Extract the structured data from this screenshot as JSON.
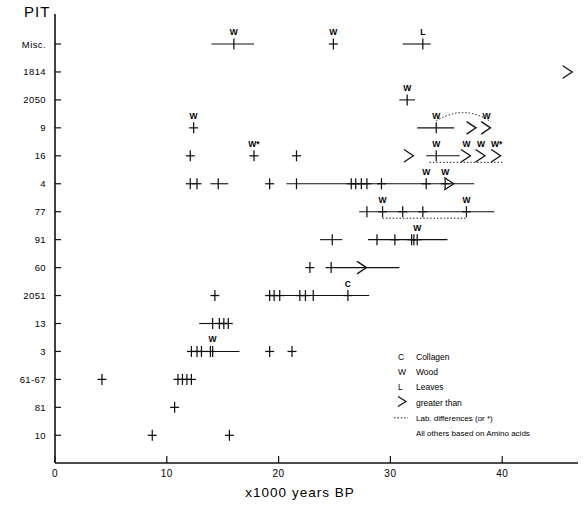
{
  "chart_data": {
    "type": "scatter",
    "title": "",
    "ylabel": "PIT",
    "xlabel": "x1000 years BP",
    "xlim": [
      0,
      41
    ],
    "xticks": [
      0,
      10,
      20,
      30,
      40
    ],
    "xticklabels": [
      "0",
      "10",
      "20",
      "30",
      "40"
    ],
    "grid": false,
    "ycategories": [
      "Misc.",
      "1814",
      "2050",
      "9",
      "16",
      "4",
      "77",
      "91",
      "60",
      "2051",
      "13",
      "3",
      "61-67",
      "81",
      "10"
    ],
    "legend_position": "lower-right",
    "legend": [
      {
        "symbol": "C",
        "label": "Collagen"
      },
      {
        "symbol": "W",
        "label": "Wood"
      },
      {
        "symbol": "L",
        "label": "Leaves"
      },
      {
        "symbol": ">",
        "label": "greater than"
      },
      {
        "symbol": "dotted",
        "label": "Lab. differences (or *)"
      },
      {
        "symbol": "",
        "label": "All others based on Amino acids"
      }
    ],
    "rows": [
      {
        "pit": "Misc.",
        "points": [
          {
            "x": 16.0,
            "label": "W",
            "err": [
              14.0,
              17.8
            ]
          },
          {
            "x": 24.9,
            "label": "W"
          },
          {
            "x": 32.9,
            "label": "L",
            "err": [
              31.1,
              33.6
            ]
          }
        ]
      },
      {
        "pit": "1814",
        "points": [
          {
            "x": 45.9,
            "gt": true
          }
        ]
      },
      {
        "pit": "2050",
        "points": [
          {
            "x": 31.5,
            "label": "W",
            "err": [
              30.8,
              32.2
            ]
          }
        ]
      },
      {
        "pit": "9",
        "points": [
          {
            "x": 12.4,
            "label": "W"
          },
          {
            "x": 34.1,
            "label": "W",
            "err": [
              32.4,
              35.7
            ]
          },
          {
            "x": 37.3,
            "gt": true
          },
          {
            "x": 38.6,
            "gt": true,
            "label": "W"
          }
        ],
        "labdiff_arc": [
          34.1,
          39.0
        ]
      },
      {
        "pit": "16",
        "points": [
          {
            "x": 12.1
          },
          {
            "x": 17.8,
            "label": "W*"
          },
          {
            "x": 21.6
          },
          {
            "x": 31.7,
            "gt": true
          },
          {
            "x": 34.1,
            "label": "W",
            "err": [
              33.2,
              36.2
            ]
          },
          {
            "x": 36.8,
            "gt": true,
            "label": "W"
          },
          {
            "x": 38.1,
            "gt": true,
            "label": "W"
          },
          {
            "x": 39.5,
            "gt": true,
            "label": "W*"
          }
        ],
        "labdiff_line": [
          33.5,
          40.0
        ]
      },
      {
        "pit": "4",
        "points": [
          {
            "x": 12.1
          },
          {
            "x": 12.7
          },
          {
            "x": 14.6,
            "err": [
              13.9,
              15.5
            ]
          },
          {
            "x": 19.2
          },
          {
            "x": 21.6,
            "err": [
              20.7,
              37.5
            ]
          },
          {
            "x": 26.5
          },
          {
            "x": 26.9
          },
          {
            "x": 27.4
          },
          {
            "x": 27.9
          },
          {
            "x": 29.2
          },
          {
            "x": 33.2,
            "label": "W"
          },
          {
            "x": 34.9,
            "label": "W"
          },
          {
            "x": 35.3,
            "gt": true
          }
        ]
      },
      {
        "pit": "77",
        "points": [
          {
            "x": 27.9,
            "err": [
              27.2,
              39.3
            ]
          },
          {
            "x": 29.3,
            "label": "W"
          },
          {
            "x": 31.1
          },
          {
            "x": 32.9
          },
          {
            "x": 36.8,
            "label": "W"
          }
        ],
        "labdiff_line": [
          29.3,
          36.8
        ]
      },
      {
        "pit": "91",
        "points": [
          {
            "x": 24.8,
            "err": [
              23.7,
              25.7
            ]
          },
          {
            "x": 28.8,
            "err": [
              28.0,
              35.1
            ]
          },
          {
            "x": 30.4
          },
          {
            "x": 31.9
          },
          {
            "x": 32.1
          },
          {
            "x": 32.4,
            "label": "W"
          }
        ]
      },
      {
        "pit": "60",
        "points": [
          {
            "x": 22.8
          },
          {
            "x": 24.7,
            "err": [
              24.2,
              30.8
            ]
          },
          {
            "x": 27.5,
            "gt": true
          }
        ]
      },
      {
        "pit": "2051",
        "points": [
          {
            "x": 14.3
          },
          {
            "x": 19.2
          },
          {
            "x": 19.6
          },
          {
            "x": 20.1
          },
          {
            "x": 21.9
          },
          {
            "x": 22.4
          },
          {
            "x": 23.1,
            "err": [
              18.9,
              28.1
            ]
          },
          {
            "x": 26.2,
            "label": "C"
          }
        ]
      },
      {
        "pit": "13",
        "points": [
          {
            "x": 14.1,
            "err": [
              12.9,
              15.6
            ]
          },
          {
            "x": 14.7
          },
          {
            "x": 15.1
          },
          {
            "x": 15.5
          }
        ]
      },
      {
        "pit": "3",
        "points": [
          {
            "x": 12.2
          },
          {
            "x": 12.7
          },
          {
            "x": 13.1
          },
          {
            "x": 13.9
          },
          {
            "x": 14.1,
            "label": "W",
            "err": [
              11.9,
              16.5
            ]
          },
          {
            "x": 19.2
          },
          {
            "x": 21.2
          }
        ]
      },
      {
        "pit": "61-67",
        "points": [
          {
            "x": 4.2
          },
          {
            "x": 11.0
          },
          {
            "x": 11.4
          },
          {
            "x": 11.8
          },
          {
            "x": 12.2
          }
        ]
      },
      {
        "pit": "81",
        "points": [
          {
            "x": 10.7
          }
        ]
      },
      {
        "pit": "10",
        "points": [
          {
            "x": 8.7
          },
          {
            "x": 15.6
          }
        ]
      }
    ]
  }
}
